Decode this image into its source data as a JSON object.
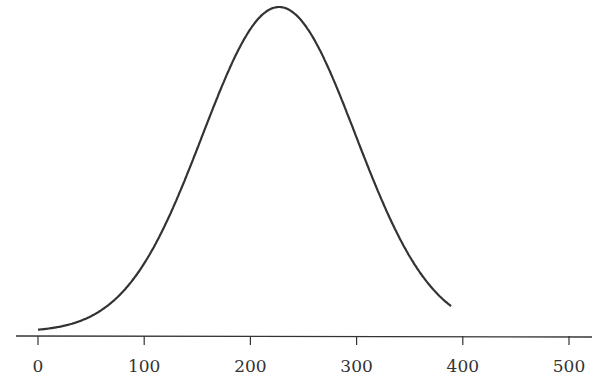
{
  "chart_data": {
    "type": "line",
    "title": "",
    "xlabel": "",
    "ylabel": "",
    "xlim": [
      0,
      500
    ],
    "xticks": [
      0,
      100,
      200,
      300,
      400,
      500
    ],
    "xtick_labels": [
      "0",
      "100",
      "200",
      "300",
      "400",
      "500"
    ],
    "grid": false,
    "legend": null,
    "series": [
      {
        "name": "normal-curve",
        "distribution": "normal",
        "mean": 227,
        "sd": 72,
        "x_range": [
          0,
          389
        ],
        "x": [
          0,
          25,
          50,
          75,
          100,
          125,
          150,
          175,
          200,
          227,
          250,
          275,
          300,
          325,
          350,
          375,
          389
        ],
        "y_relative": [
          0.007,
          0.02,
          0.05,
          0.11,
          0.21,
          0.37,
          0.56,
          0.77,
          0.93,
          1.0,
          0.95,
          0.8,
          0.6,
          0.4,
          0.23,
          0.12,
          0.08
        ]
      }
    ],
    "line_color": "#333333"
  }
}
